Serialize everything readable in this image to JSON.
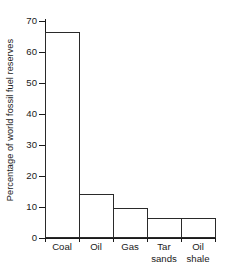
{
  "chart_data": {
    "type": "bar",
    "title": "",
    "xlabel": "",
    "ylabel": "Percentage of world fossil fuel reserves",
    "categories": [
      "Coal",
      "Oil",
      "Gas",
      "Tar sands",
      "Oil shale"
    ],
    "category_lines": [
      [
        "Coal"
      ],
      [
        "Oil"
      ],
      [
        "Gas"
      ],
      [
        "Tar",
        "sands"
      ],
      [
        "Oil",
        "shale"
      ]
    ],
    "values": [
      66,
      14,
      9.5,
      6,
      6
    ],
    "ylim": [
      0,
      70
    ],
    "yticks": [
      0,
      10,
      20,
      30,
      40,
      50,
      60,
      70
    ],
    "ytick_labels": [
      "0",
      "10",
      "20",
      "30",
      "40",
      "50",
      "60",
      "70"
    ],
    "grid": false,
    "legend": false,
    "bar_fill": "#ffffff",
    "bar_edge": "#2a2a2a",
    "background": "#ffffff"
  }
}
